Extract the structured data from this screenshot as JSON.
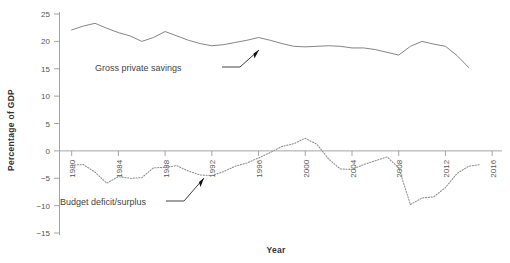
{
  "chart_data": {
    "type": "line",
    "title": "",
    "xlabel": "Year",
    "ylabel": "Percentage of GDP",
    "xlim": [
      1979,
      2016.5
    ],
    "ylim": [
      -15,
      25
    ],
    "xticks": [
      1980,
      1984,
      1988,
      1992,
      1996,
      2000,
      2004,
      2008,
      2012,
      2016
    ],
    "xticklabels": [
      "1980",
      "1984",
      "1988",
      "1992",
      "1996",
      "2000",
      "2004",
      "2008",
      "2012",
      "2016"
    ],
    "yticks": [
      -15,
      -10,
      -5,
      0,
      5,
      10,
      15,
      20,
      25
    ],
    "yticklabels": [
      "−15",
      "−10",
      "−5",
      "0",
      "5",
      "10",
      "15",
      "20",
      "25"
    ],
    "grid": false,
    "legend": "annotations",
    "zero_line": true,
    "series": [
      {
        "name": "Gross private savings",
        "style": "solid",
        "color": "#6f6f6f",
        "x": [
          1980,
          1981,
          1982,
          1983,
          1984,
          1985,
          1986,
          1987,
          1988,
          1989,
          1990,
          1991,
          1992,
          1993,
          1994,
          1995,
          1996,
          1997,
          1998,
          1999,
          2000,
          2001,
          2002,
          2003,
          2004,
          2005,
          2006,
          2007,
          2008,
          2009,
          2010,
          2011,
          2012,
          2013,
          2014
        ],
        "y": [
          22.1,
          22.8,
          23.3,
          22.4,
          21.6,
          21.0,
          20.0,
          20.7,
          21.8,
          21.0,
          20.2,
          19.6,
          19.2,
          19.4,
          19.8,
          20.2,
          20.7,
          20.2,
          19.6,
          19.1,
          19.0,
          19.1,
          19.2,
          19.1,
          18.8,
          18.8,
          18.5,
          18.0,
          17.5,
          19.1,
          20.0,
          19.5,
          19.1,
          17.4,
          15.2
        ]
      },
      {
        "name": "Budget deficit/surplus",
        "style": "dotted",
        "color": "#8d8d8d",
        "x": [
          1980,
          1981,
          1982,
          1983,
          1984,
          1985,
          1986,
          1987,
          1988,
          1989,
          1990,
          1991,
          1992,
          1993,
          1994,
          1995,
          1996,
          1997,
          1998,
          1999,
          2000,
          2001,
          2002,
          2003,
          2004,
          2005,
          2006,
          2007,
          2008,
          2009,
          2010,
          2011,
          2012,
          2013,
          2014,
          2015
        ],
        "y": [
          -2.6,
          -2.5,
          -3.9,
          -5.9,
          -4.7,
          -5.0,
          -4.9,
          -3.1,
          -3.0,
          -2.7,
          -3.7,
          -4.4,
          -4.5,
          -3.8,
          -2.8,
          -2.2,
          -1.3,
          -0.3,
          0.8,
          1.3,
          2.3,
          1.2,
          -1.5,
          -3.3,
          -3.4,
          -2.5,
          -1.8,
          -1.1,
          -3.1,
          -9.8,
          -8.6,
          -8.4,
          -6.7,
          -4.1,
          -2.8,
          -2.5
        ]
      }
    ],
    "annotations": [
      {
        "id": "savings-annotation",
        "text": "Gross private savings",
        "target_series": "Gross private savings",
        "points_to_year": 2009
      },
      {
        "id": "deficit-annotation",
        "text": "Budget deficit/surplus",
        "target_series": "Budget deficit/surplus",
        "points_to_year": 1992
      }
    ]
  }
}
